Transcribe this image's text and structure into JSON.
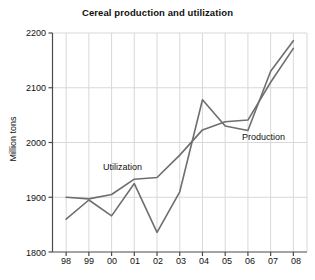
{
  "chart_data": {
    "type": "line",
    "title": "Cereal production and utilization",
    "xlabel": "",
    "ylabel": "Million tons",
    "x": [
      "98",
      "99",
      "00",
      "01",
      "02",
      "03",
      "04",
      "05",
      "06",
      "07",
      "08"
    ],
    "xtick_labels": [
      "98",
      "99",
      "00",
      "01",
      "02",
      "03",
      "04",
      "05",
      "06",
      "07",
      "08"
    ],
    "ytick_labels": [
      "1800",
      "1900",
      "2000",
      "2100",
      "2200"
    ],
    "ylim": [
      1800,
      2200
    ],
    "ytick_step": 100,
    "grid": "vertical and horizontal light gridlines",
    "legend_position": "inline labels next to curves",
    "series": [
      {
        "name": "Production",
        "label": "Production",
        "color": "#6e6e6e",
        "values": [
          1860,
          1895,
          1866,
          1925,
          1836,
          1910,
          2078,
          2030,
          2022,
          2130,
          2186
        ]
      },
      {
        "name": "Utilization",
        "label": "Utilization",
        "color": "#6e6e6e",
        "values": [
          1900,
          1897,
          1905,
          1933,
          1936,
          1977,
          2023,
          2038,
          2041,
          2110,
          2172
        ]
      }
    ],
    "annotations": [
      {
        "text": "Utilization",
        "x_px": 103,
        "y_px": 162
      },
      {
        "text": "Production",
        "x_px": 242,
        "y_px": 132
      }
    ]
  },
  "axis": {
    "y_ticks": [
      {
        "label": "2200",
        "value": 2200
      },
      {
        "label": "2100",
        "value": 2100
      },
      {
        "label": "2000",
        "value": 2000
      },
      {
        "label": "1900",
        "value": 1900
      },
      {
        "label": "1800",
        "value": 1800
      }
    ],
    "x_ticks": [
      {
        "label": "98"
      },
      {
        "label": "99"
      },
      {
        "label": "00"
      },
      {
        "label": "01"
      },
      {
        "label": "02"
      },
      {
        "label": "03"
      },
      {
        "label": "04"
      },
      {
        "label": "05"
      },
      {
        "label": "06"
      },
      {
        "label": "07"
      },
      {
        "label": "08"
      }
    ]
  },
  "colors": {
    "line": "#6e6e6e",
    "axis": "#4a4a4a",
    "grid": "#d8d8d8",
    "text": "#101010",
    "background": "#ffffff"
  }
}
